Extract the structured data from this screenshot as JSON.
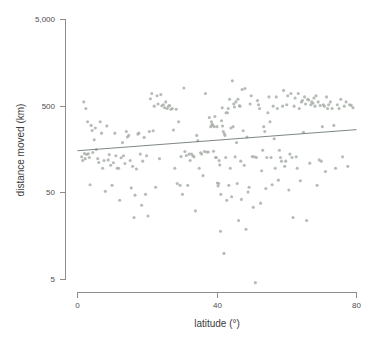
{
  "chart_data": {
    "type": "scatter",
    "title": "",
    "xlabel": "latitude (°)",
    "ylabel": "distance moved (km)",
    "xlim": [
      0,
      80
    ],
    "ylim": [
      5,
      5000
    ],
    "yscale": "log",
    "xscale": "linear",
    "grid": false,
    "legend": null,
    "xticks": [
      0,
      40,
      80
    ],
    "xticklabels": [
      "0",
      "40",
      "80"
    ],
    "yticks": [
      5,
      50,
      500,
      5000
    ],
    "yticklabels": [
      "5",
      "50",
      "500",
      "5,000"
    ],
    "marker": {
      "shape": "circle",
      "size_px": 3.1,
      "color": "#a8b0a8",
      "opacity": 0.85
    },
    "trendline": {
      "type": "linear-fit-on-log-y",
      "color": "#6f7a70",
      "x_start": 0,
      "y_start": 153,
      "x_end": 80,
      "y_end": 268,
      "description": "slightly increasing regression line"
    },
    "series": [
      {
        "name": "distance moved",
        "points": [
          [
            1.2,
            130
          ],
          [
            1.5,
            118
          ],
          [
            1.8,
            560
          ],
          [
            2.0,
            142
          ],
          [
            2.2,
            124
          ],
          [
            2.4,
            470
          ],
          [
            2.6,
            139
          ],
          [
            2.9,
            330
          ],
          [
            3.1,
            141
          ],
          [
            3.4,
            128
          ],
          [
            3.6,
            62
          ],
          [
            3.9,
            300
          ],
          [
            4.2,
            262
          ],
          [
            4.4,
            146
          ],
          [
            4.8,
            205
          ],
          [
            5.1,
            280
          ],
          [
            5.4,
            158
          ],
          [
            5.8,
            124
          ],
          [
            6.1,
            112
          ],
          [
            6.5,
            330
          ],
          [
            6.9,
            244
          ],
          [
            7.2,
            96
          ],
          [
            7.6,
            118
          ],
          [
            8.0,
            52
          ],
          [
            8.4,
            296
          ],
          [
            8.8,
            120
          ],
          [
            9.1,
            138
          ],
          [
            9.5,
            104
          ],
          [
            9.9,
            61
          ],
          [
            10.3,
            111
          ],
          [
            10.7,
            244
          ],
          [
            11.0,
            134
          ],
          [
            11.4,
            96
          ],
          [
            11.8,
            96
          ],
          [
            12.1,
            41
          ],
          [
            12.5,
            127
          ],
          [
            12.9,
            190
          ],
          [
            13.2,
            134
          ],
          [
            13.6,
            109
          ],
          [
            14.0,
            255
          ],
          [
            14.3,
            220
          ],
          [
            14.7,
            230
          ],
          [
            15.1,
            118
          ],
          [
            15.4,
            57
          ],
          [
            15.8,
            101
          ],
          [
            16.2,
            26
          ],
          [
            16.5,
            47
          ],
          [
            16.9,
            94
          ],
          [
            17.3,
            238
          ],
          [
            17.6,
            244
          ],
          [
            18.0,
            140
          ],
          [
            18.4,
            36
          ],
          [
            18.7,
            116
          ],
          [
            19.1,
            218
          ],
          [
            19.5,
            48
          ],
          [
            19.8,
            134
          ],
          [
            20.2,
            27
          ],
          [
            20.6,
            255
          ],
          [
            20.9,
            610
          ],
          [
            21.3,
            700
          ],
          [
            21.7,
            260
          ],
          [
            22.0,
            500
          ],
          [
            22.4,
            58
          ],
          [
            22.8,
            660
          ],
          [
            23.1,
            530
          ],
          [
            23.5,
            124
          ],
          [
            23.9,
            680
          ],
          [
            24.2,
            505
          ],
          [
            24.6,
            520
          ],
          [
            25.0,
            480
          ],
          [
            25.3,
            560
          ],
          [
            25.7,
            470
          ],
          [
            26.1,
            500
          ],
          [
            26.4,
            508
          ],
          [
            26.8,
            460
          ],
          [
            27.2,
            470
          ],
          [
            27.5,
            265
          ],
          [
            27.9,
            96
          ],
          [
            28.3,
            460
          ],
          [
            28.6,
            64
          ],
          [
            29.0,
            330
          ],
          [
            29.4,
            61
          ],
          [
            29.7,
            131
          ],
          [
            30.1,
            48
          ],
          [
            30.5,
            810
          ],
          [
            30.8,
            150
          ],
          [
            31.2,
            135
          ],
          [
            31.6,
            61
          ],
          [
            32.0,
            140
          ],
          [
            32.3,
            118
          ],
          [
            32.7,
            140
          ],
          [
            33.1,
            134
          ],
          [
            33.4,
            130
          ],
          [
            33.8,
            31
          ],
          [
            34.2,
            230
          ],
          [
            34.5,
            200
          ],
          [
            34.9,
            96
          ],
          [
            35.3,
            145
          ],
          [
            35.6,
            140
          ],
          [
            36.0,
            79
          ],
          [
            36.4,
            150
          ],
          [
            36.7,
            700
          ],
          [
            37.1,
            148
          ],
          [
            37.5,
            148
          ],
          [
            37.8,
            370
          ],
          [
            38.2,
            290
          ],
          [
            38.4,
            330
          ],
          [
            38.6,
            310
          ],
          [
            38.8,
            300
          ],
          [
            39.0,
            151
          ],
          [
            39.2,
            290
          ],
          [
            39.4,
            380
          ],
          [
            39.6,
            128
          ],
          [
            39.8,
            128
          ],
          [
            40.0,
            290
          ],
          [
            40.1,
            65
          ],
          [
            40.3,
            60
          ],
          [
            40.5,
            64
          ],
          [
            40.6,
            118
          ],
          [
            40.8,
            105
          ],
          [
            41.0,
            18
          ],
          [
            41.1,
            48
          ],
          [
            41.3,
            340
          ],
          [
            41.5,
            480
          ],
          [
            41.6,
            295
          ],
          [
            41.8,
            255
          ],
          [
            42.0,
            10
          ],
          [
            42.1,
            240
          ],
          [
            42.3,
            230
          ],
          [
            42.5,
            128
          ],
          [
            42.6,
            420
          ],
          [
            42.8,
            41
          ],
          [
            43.0,
            420
          ],
          [
            43.2,
            470
          ],
          [
            43.4,
            61
          ],
          [
            43.6,
            600
          ],
          [
            43.8,
            96
          ],
          [
            44.0,
            280
          ],
          [
            44.2,
            45
          ],
          [
            44.4,
            980
          ],
          [
            44.6,
            290
          ],
          [
            44.8,
            530
          ],
          [
            45.0,
            490
          ],
          [
            45.2,
            130
          ],
          [
            45.4,
            560
          ],
          [
            45.6,
            190
          ],
          [
            45.8,
            64
          ],
          [
            46.0,
            600
          ],
          [
            46.2,
            24
          ],
          [
            46.4,
            505
          ],
          [
            46.6,
            500
          ],
          [
            46.8,
            116
          ],
          [
            47.0,
            42
          ],
          [
            47.2,
            780
          ],
          [
            47.5,
            260
          ],
          [
            47.8,
            104
          ],
          [
            48.0,
            800
          ],
          [
            48.3,
            19
          ],
          [
            48.6,
            220
          ],
          [
            48.9,
            51
          ],
          [
            49.2,
            58
          ],
          [
            49.5,
            530
          ],
          [
            49.8,
            660
          ],
          [
            50.1,
            131
          ],
          [
            50.4,
            34
          ],
          [
            50.7,
            130
          ],
          [
            51.0,
            4.6
          ],
          [
            51.3,
            128
          ],
          [
            51.6,
            580
          ],
          [
            51.9,
            520
          ],
          [
            52.2,
            470
          ],
          [
            52.5,
            38
          ],
          [
            52.8,
            90
          ],
          [
            53.1,
            155
          ],
          [
            53.4,
            290
          ],
          [
            53.7,
            255
          ],
          [
            54.0,
            56
          ],
          [
            54.3,
            128
          ],
          [
            54.6,
            420
          ],
          [
            54.9,
            640
          ],
          [
            55.2,
            330
          ],
          [
            55.5,
            128
          ],
          [
            55.8,
            62
          ],
          [
            56.1,
            500
          ],
          [
            56.4,
            210
          ],
          [
            56.7,
            96
          ],
          [
            57.0,
            640
          ],
          [
            57.3,
            470
          ],
          [
            57.6,
            70
          ],
          [
            57.9,
            155
          ],
          [
            58.2,
            128
          ],
          [
            58.5,
            116
          ],
          [
            58.8,
            500
          ],
          [
            59.1,
            760
          ],
          [
            59.4,
            101
          ],
          [
            59.7,
            116
          ],
          [
            60.0,
            520
          ],
          [
            60.3,
            660
          ],
          [
            60.6,
            54
          ],
          [
            60.9,
            140
          ],
          [
            61.2,
            700
          ],
          [
            61.5,
            128
          ],
          [
            61.8,
            26
          ],
          [
            62.1,
            500
          ],
          [
            62.4,
            620
          ],
          [
            62.7,
            130
          ],
          [
            63.0,
            96
          ],
          [
            63.3,
            700
          ],
          [
            63.6,
            470
          ],
          [
            63.9,
            69
          ],
          [
            64.2,
            560
          ],
          [
            64.5,
            580
          ],
          [
            64.8,
            250
          ],
          [
            65.1,
            640
          ],
          [
            65.4,
            530
          ],
          [
            65.7,
            24
          ],
          [
            66.0,
            600
          ],
          [
            66.3,
            590
          ],
          [
            66.6,
            110
          ],
          [
            66.9,
            520
          ],
          [
            67.2,
            560
          ],
          [
            67.5,
            540
          ],
          [
            67.8,
            620
          ],
          [
            68.1,
            500
          ],
          [
            68.4,
            660
          ],
          [
            68.7,
            61
          ],
          [
            69.0,
            560
          ],
          [
            69.3,
            120
          ],
          [
            69.6,
            508
          ],
          [
            69.9,
            116
          ],
          [
            70.2,
            290
          ],
          [
            70.5,
            520
          ],
          [
            70.8,
            500
          ],
          [
            71.1,
            88
          ],
          [
            71.4,
            640
          ],
          [
            71.7,
            470
          ],
          [
            72.0,
            520
          ],
          [
            72.5,
            560
          ],
          [
            73.0,
            470
          ],
          [
            73.5,
            300
          ],
          [
            74.0,
            96
          ],
          [
            74.5,
            520
          ],
          [
            75.0,
            470
          ],
          [
            75.5,
            600
          ],
          [
            76.0,
            130
          ],
          [
            76.5,
            500
          ],
          [
            77.0,
            560
          ],
          [
            77.5,
            101
          ],
          [
            78.0,
            520
          ],
          [
            78.5,
            510
          ],
          [
            79.0,
            480
          ]
        ]
      }
    ]
  },
  "axes": {
    "x_title": "latitude (°)",
    "y_title": "distance moved (km)",
    "x_tick_labels": [
      "0",
      "40",
      "80"
    ],
    "y_tick_labels": [
      "5,000",
      "500",
      "50",
      "5"
    ]
  },
  "colors": {
    "point": "#a8b0a8",
    "trendline": "#6f7a70",
    "axis": "#8c8c8c",
    "text": "#4d4d4d",
    "background": "#ffffff"
  }
}
